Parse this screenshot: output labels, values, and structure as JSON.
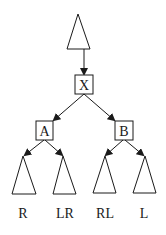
{
  "diagram": {
    "type": "tree-rotation",
    "root_subtree": {
      "shape": "triangle"
    },
    "nodes": [
      {
        "id": "X",
        "label": "X"
      },
      {
        "id": "A",
        "label": "A"
      },
      {
        "id": "B",
        "label": "B"
      }
    ],
    "edges": [
      {
        "from": "root_subtree",
        "to": "X"
      },
      {
        "from": "X",
        "to": "A"
      },
      {
        "from": "X",
        "to": "B"
      },
      {
        "from": "A",
        "to": "R"
      },
      {
        "from": "A",
        "to": "LR"
      },
      {
        "from": "B",
        "to": "RL"
      },
      {
        "from": "B",
        "to": "L"
      }
    ],
    "leaves": [
      {
        "id": "R",
        "label": "R"
      },
      {
        "id": "LR",
        "label": "LR"
      },
      {
        "id": "RL",
        "label": "RL"
      },
      {
        "id": "L",
        "label": "L"
      }
    ],
    "colors": {
      "stroke": "#1a1a1a",
      "background": "#ffffff"
    }
  }
}
